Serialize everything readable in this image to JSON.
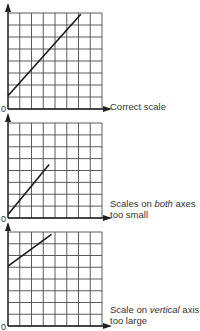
{
  "chart_data": [
    {
      "type": "line",
      "title": "",
      "caption": "Correct scale",
      "caption_lines": [
        "Correct scale"
      ],
      "origin_label": "0",
      "grid": {
        "cols": 8,
        "rows": 8,
        "on": true
      },
      "xlim": [
        0,
        8
      ],
      "ylim": [
        0,
        8
      ],
      "series": [
        {
          "name": "line",
          "x": [
            0,
            6.2
          ],
          "y": [
            1.1,
            7.9
          ]
        }
      ]
    },
    {
      "type": "line",
      "title": "",
      "caption": "Scales on both axes too small",
      "caption_lines": [
        "Scales on both axes",
        "too small"
      ],
      "caption_emphasis": "both",
      "origin_label": "0",
      "grid": {
        "cols": 8,
        "rows": 8,
        "on": true
      },
      "xlim": [
        0,
        8
      ],
      "ylim": [
        0,
        8
      ],
      "series": [
        {
          "name": "line",
          "x": [
            0,
            3.5
          ],
          "y": [
            0.3,
            4.5
          ]
        }
      ]
    },
    {
      "type": "line",
      "title": "",
      "caption": "Scale on vertical axis too large",
      "caption_lines": [
        "Scale on vertical axis",
        "too large"
      ],
      "caption_emphasis": "vertical",
      "origin_label": "0",
      "grid": {
        "cols": 8,
        "rows": 8,
        "on": true
      },
      "xlim": [
        0,
        8
      ],
      "ylim": [
        0,
        8
      ],
      "series": [
        {
          "name": "line",
          "x": [
            0,
            3.7
          ],
          "y": [
            5.1,
            7.8
          ]
        }
      ]
    }
  ],
  "panels": [
    {
      "caption_line1_pre": "Correct scale",
      "caption_line1_em": "",
      "caption_line1_post": "",
      "caption_line2": "",
      "zero": "0"
    },
    {
      "caption_line1_pre": "Scales on ",
      "caption_line1_em": "both",
      "caption_line1_post": " axes",
      "caption_line2": "too small",
      "zero": "0"
    },
    {
      "caption_line1_pre": "Scale on ",
      "caption_line1_em": "vertical",
      "caption_line1_post": " axis",
      "caption_line2": "too large",
      "zero": "0"
    }
  ],
  "colors": {
    "grid": "#4a4a4a",
    "line": "#1a1a1a",
    "text": "#333333"
  }
}
